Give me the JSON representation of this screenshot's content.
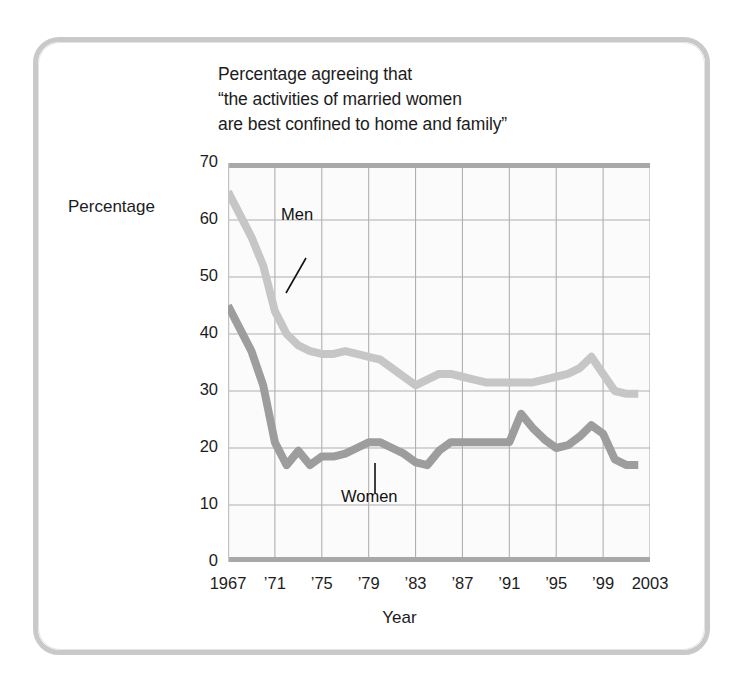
{
  "figure": {
    "title_lines": [
      "Percentage agreeing that",
      "“the activities of married women",
      "are best confined to home and family”"
    ],
    "y_axis_title": "Percentage",
    "x_axis_title": "Year",
    "men_label": "Men",
    "women_label": "Women",
    "men_color": "#c6c6c6",
    "women_color": "#9d9d9d",
    "grid_color": "#b0b0b0",
    "frame_color": "#c9c9c9"
  },
  "chart_data": {
    "type": "line",
    "title": "Percentage agreeing that “the activities of married women are best confined to home and family”",
    "xlabel": "Year",
    "ylabel": "Percentage",
    "xlim": [
      1967,
      2003
    ],
    "ylim": [
      0,
      70
    ],
    "yticks": [
      0,
      10,
      20,
      30,
      40,
      50,
      60,
      70
    ],
    "ytick_labels": [
      "0",
      "10",
      "20",
      "30",
      "40",
      "50",
      "60",
      "70"
    ],
    "xticks": [
      1967,
      1971,
      1975,
      1979,
      1983,
      1987,
      1991,
      1995,
      1999,
      2003
    ],
    "xtick_labels": [
      "1967",
      "’71",
      "’75",
      "’79",
      "’83",
      "’87",
      "’91",
      "’95",
      "’99",
      "2003"
    ],
    "grid": true,
    "legend": "inline-annotations",
    "x": [
      1967,
      1968,
      1969,
      1970,
      1971,
      1972,
      1973,
      1974,
      1975,
      1976,
      1977,
      1978,
      1979,
      1980,
      1981,
      1982,
      1983,
      1984,
      1985,
      1986,
      1987,
      1988,
      1989,
      1990,
      1991,
      1992,
      1993,
      1994,
      1995,
      1996,
      1997,
      1998,
      1999,
      2000,
      2001,
      2002
    ],
    "series": [
      {
        "name": "Men",
        "color": "#c6c6c6",
        "values": [
          65,
          61,
          57,
          52,
          44,
          40,
          38,
          37,
          36.5,
          36.5,
          37,
          36.5,
          36,
          35.5,
          34,
          32.5,
          31,
          32,
          33,
          33,
          32.5,
          32,
          31.5,
          31.5,
          31.5,
          31.5,
          31.5,
          32,
          32.5,
          33,
          34,
          36,
          33,
          30,
          29.5,
          29.5
        ]
      },
      {
        "name": "Women",
        "color": "#9d9d9d",
        "values": [
          45,
          41,
          37,
          31,
          21,
          17,
          19.5,
          17,
          18.5,
          18.5,
          19,
          20,
          21,
          21,
          20,
          19,
          17.5,
          17,
          19.5,
          21,
          21,
          21,
          21,
          21,
          21,
          26,
          23.5,
          21.5,
          20,
          20.5,
          22,
          24,
          22.5,
          18,
          17,
          17
        ]
      }
    ]
  }
}
